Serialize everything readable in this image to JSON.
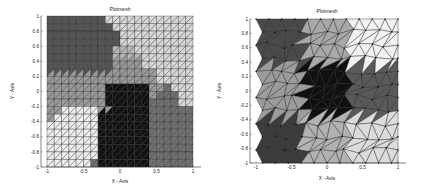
{
  "chart_data": [
    {
      "type": "heatmap",
      "subtype": "mesh-partition (structured triangular grid)",
      "title": "Plotmesh",
      "xlabel": "X - Axis",
      "ylabel": "Y - Axis",
      "xlim": [
        -1,
        1
      ],
      "ylim": [
        -1,
        1
      ],
      "xticks": [
        "-1",
        "-0.5",
        "0",
        "0.5",
        "1"
      ],
      "yticks": [
        "1",
        "0.8",
        "0.6",
        "0.4",
        "0.2",
        "0",
        "-0.2",
        "-0.4",
        "-0.6",
        "-0.8",
        "-1"
      ],
      "grid": "20x20 structured mesh, diagonals",
      "regions": [
        {
          "name": "top-left",
          "shade": "#555555"
        },
        {
          "name": "middle-left band",
          "shade": "#9a9a9a"
        },
        {
          "name": "top-right",
          "shade": "#d8d8d8"
        },
        {
          "name": "center",
          "shade": "#111111"
        },
        {
          "name": "bottom-left",
          "shade": "#efefef"
        },
        {
          "name": "bottom-right",
          "shade": "#707070"
        },
        {
          "name": "top-middle",
          "shade": "#b8b8b8"
        }
      ]
    },
    {
      "type": "heatmap",
      "subtype": "mesh-partition (unstructured triangular mesh)",
      "title": "Plotmesh",
      "xlabel": "X - Axis",
      "ylabel": "Y - Axis",
      "xlim": [
        -1,
        1
      ],
      "ylim": [
        -1,
        1
      ],
      "xticks": [
        "-1",
        "-0.5",
        "0",
        "0.5",
        "1"
      ],
      "yticks": [
        "1",
        "0.8",
        "0.6",
        "0.4",
        "0.2",
        "0",
        "-0.2",
        "-0.4",
        "-0.6",
        "-0.8",
        "-1"
      ],
      "grid": "3x3 partition of unstructured mesh",
      "regions": [
        {
          "name": "top-left",
          "shade": "#4a4a4a"
        },
        {
          "name": "top-center",
          "shade": "#a8a8a8"
        },
        {
          "name": "top-right",
          "shade": "#f2f2f2"
        },
        {
          "name": "middle-left",
          "shade": "#9c9c9c"
        },
        {
          "name": "center",
          "shade": "#101010"
        },
        {
          "name": "middle-right",
          "shade": "#5a5a5a"
        },
        {
          "name": "bottom-left",
          "shade": "#3c3c3c"
        },
        {
          "name": "bottom-center",
          "shade": "#b2b2b2"
        },
        {
          "name": "bottom-right",
          "shade": "#dcdcdc"
        }
      ]
    }
  ],
  "left": {
    "title": "Plotmesh",
    "xlabel": "X - Axis",
    "ylabel": "Y - Axis"
  },
  "right": {
    "title": "Plotmesh",
    "xlabel": "X - Axis",
    "ylabel": "Y - Axis"
  }
}
